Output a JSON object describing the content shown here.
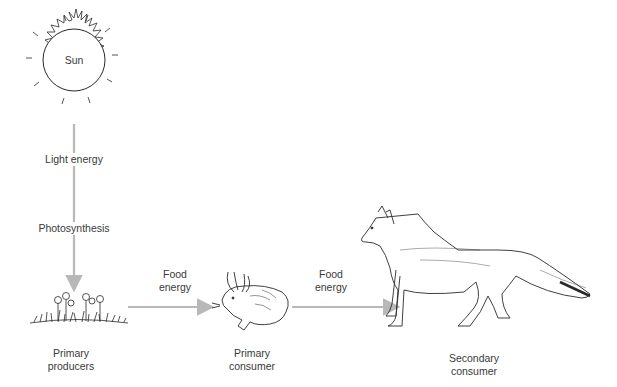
{
  "diagram": {
    "type": "food-chain",
    "colors": {
      "arrow": "#b8b8b8",
      "line_art": "#2a2a2a",
      "text": "#3a3a3a",
      "background": "#ffffff"
    },
    "sun": {
      "label": "Sun"
    },
    "vertical_flow": {
      "upper_label": "Light energy",
      "lower_label": "Photosynthesis"
    },
    "nodes": [
      {
        "id": "producers",
        "label_line1": "Primary",
        "label_line2": "producers",
        "icon": "plants-icon"
      },
      {
        "id": "primary",
        "label_line1": "Primary",
        "label_line2": "consumer",
        "icon": "rabbit-icon"
      },
      {
        "id": "secondary",
        "label_line1": "Secondary",
        "label_line2": "consumer",
        "icon": "fox-icon"
      }
    ],
    "arrows": [
      {
        "label_line1": "Food",
        "label_line2": "energy"
      },
      {
        "label_line1": "Food",
        "label_line2": "energy"
      }
    ]
  }
}
